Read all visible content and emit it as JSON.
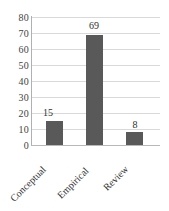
{
  "chart_data": {
    "type": "bar",
    "title": "",
    "subtitle": "",
    "xlabel": "",
    "ylabel": "",
    "categories": [
      "Conceptual",
      "Empirical",
      "Review"
    ],
    "values": [
      15,
      69,
      8
    ],
    "data_labels": [
      "15",
      "69",
      "8"
    ],
    "ylim": [
      0,
      80
    ],
    "ytick_labels": [
      "0",
      "10",
      "20",
      "30",
      "40",
      "50",
      "60",
      "70",
      "80"
    ],
    "ytick_values": [
      0,
      10,
      20,
      30,
      40,
      50,
      60,
      70,
      80
    ],
    "grid": true,
    "grid_axis": "y",
    "legend": false,
    "legend_position": "none",
    "bar_color": "#595959",
    "grid_color": "#d9d9d9",
    "axis_color": "#b0b0b0",
    "text_color": "#2e2e2e",
    "background_color": "#ffffff",
    "xtick_rotation": -45
  }
}
